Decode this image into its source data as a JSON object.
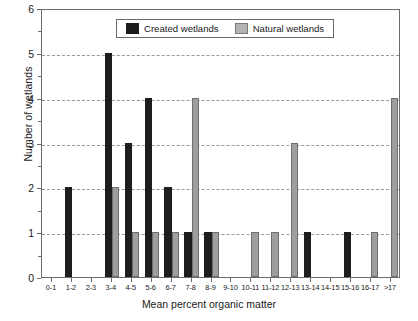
{
  "chart_data": {
    "type": "bar",
    "title": "",
    "xlabel": "Mean percent organic matter",
    "ylabel": "Number of wetlands",
    "ylim": [
      0,
      6
    ],
    "yticks": [
      0,
      1,
      2,
      3,
      4,
      5,
      6
    ],
    "grid": "horizontal-dashed",
    "legend_position": "top-center",
    "categories": [
      "0-1",
      "1-2",
      "2-3",
      "3-4",
      "4-5",
      "5-6",
      "6-7",
      "7-8",
      "8-9",
      "9-10",
      "10-11",
      "11-12",
      "12-13",
      "13-14",
      "14-15",
      "15-16",
      "16-17",
      ">17"
    ],
    "series": [
      {
        "name": "Created wetlands",
        "color": "#1d1d1d",
        "values": [
          0,
          2,
          0,
          5,
          3,
          4,
          2,
          1,
          1,
          0,
          0,
          0,
          0,
          1,
          0,
          1,
          0,
          0
        ]
      },
      {
        "name": "Natural wetlands",
        "color": "#9e9e9e",
        "values": [
          0,
          0,
          0,
          2,
          1,
          1,
          1,
          4,
          1,
          0,
          1,
          1,
          3,
          0,
          0,
          0,
          1,
          4
        ]
      }
    ]
  },
  "legend": {
    "entries": [
      {
        "label": "Created wetlands",
        "swatch": "created"
      },
      {
        "label": "Natural wetlands",
        "swatch": "natural"
      }
    ]
  },
  "axes": {
    "y_title": "Number of wetlands",
    "x_title": "Mean percent organic matter",
    "y_tick_labels": [
      "0",
      "1",
      "2",
      "3",
      "4",
      "5",
      "6"
    ]
  }
}
